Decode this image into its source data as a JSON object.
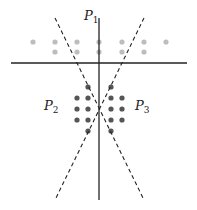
{
  "diagram": {
    "labels": {
      "p1": {
        "main": "P",
        "sub": "1",
        "x": 84,
        "y": 20
      },
      "p2": {
        "main": "P",
        "sub": "2",
        "x": 44,
        "y": 110
      },
      "p3": {
        "main": "P",
        "sub": "3",
        "x": 135,
        "y": 110
      }
    },
    "colors": {
      "light_dots": "#bdbdbd",
      "dark_dots": "#555555",
      "lines": "#222222"
    },
    "horizontal_line": {
      "x1": 11,
      "y1": 63,
      "x2": 187,
      "y2": 63
    },
    "vertical_line": {
      "x1": 99,
      "y1": 18,
      "x2": 99,
      "y2": 200
    },
    "dashed_lines": [
      {
        "x1": 55,
        "y1": 18,
        "x2": 144,
        "y2": 200
      },
      {
        "x1": 144,
        "y1": 18,
        "x2": 55,
        "y2": 200
      }
    ],
    "light_dots": [
      [
        33,
        42
      ],
      [
        55,
        42
      ],
      [
        77,
        42
      ],
      [
        99,
        42
      ],
      [
        122,
        42
      ],
      [
        144,
        42
      ],
      [
        166,
        42
      ],
      [
        55,
        52
      ],
      [
        77,
        52
      ],
      [
        99,
        52
      ],
      [
        122,
        52
      ],
      [
        144,
        52
      ]
    ],
    "dark_dots": [
      [
        88,
        87
      ],
      [
        111,
        87
      ],
      [
        77,
        98
      ],
      [
        88,
        98
      ],
      [
        111,
        98
      ],
      [
        122,
        98
      ],
      [
        77,
        109
      ],
      [
        88,
        109
      ],
      [
        111,
        109
      ],
      [
        122,
        109
      ],
      [
        77,
        120
      ],
      [
        88,
        120
      ],
      [
        111,
        120
      ],
      [
        122,
        120
      ],
      [
        88,
        131
      ],
      [
        111,
        131
      ]
    ]
  }
}
